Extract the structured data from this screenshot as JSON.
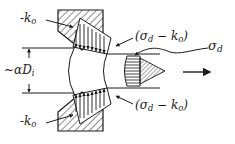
{
  "diagram": {
    "type": "wire drawing die stress distribution",
    "colors": {
      "ink": "#1a1a1a",
      "background": "#ffffff"
    },
    "labels": {
      "die_pressure_top": {
        "prefix": "-k",
        "sub": "o"
      },
      "die_pressure_bottom": {
        "prefix": "-k",
        "sub": "o"
      },
      "contact_stress_top": {
        "open": "(σ",
        "sub1": "d",
        "mid": " − k",
        "sub2": "o",
        "close": ")"
      },
      "contact_stress_bottom": {
        "open": "(σ",
        "sub1": "d",
        "mid": " − k",
        "sub2": "o",
        "close": ")"
      },
      "draw_stress": {
        "prefix": "σ",
        "sub": "d"
      },
      "diameter": {
        "prefix": "~αD",
        "sub": "i"
      }
    },
    "elements": [
      "upper-die-block",
      "lower-die-block",
      "upper-pressure-distribution",
      "lower-pressure-distribution",
      "curved-wire-deformation-zone",
      "exit-stress-distribution",
      "draw-direction-arrow",
      "diameter-dimension"
    ]
  }
}
